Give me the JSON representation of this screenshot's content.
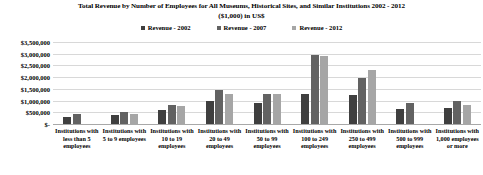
{
  "chart_data": {
    "type": "bar",
    "title": "Total Revenue by Number of Employees for All Museums, Historical Sites, and Similar Institutions 2002 - 2012",
    "subtitle": "($1,000) in US$",
    "xlabel": "",
    "ylabel": "",
    "ylim": [
      0,
      3500000
    ],
    "grid": true,
    "legend_position": "top-center",
    "categories": [
      "Institutions with less than 5 employees",
      "Institutions with 5 to 9 employees",
      "Institutions with 10 to 19 employees",
      "Institutions with 20 to 49 employees",
      "Institutions with 50 to 99 employees",
      "Institutions with 100 to 249 employees",
      "Institutions with 250 to 499 employees",
      "Institutions with 500 to 999 employees",
      "Institutions with 1,000 employees or more"
    ],
    "ytick_labels": [
      "$3,500,000",
      "$3,000,000",
      "$2,500,000",
      "$2,000,000",
      "$1,500,000",
      "$1,000,000",
      "$500,000",
      "$-"
    ],
    "ytick_values": [
      3500000,
      3000000,
      2500000,
      2000000,
      1500000,
      1000000,
      500000,
      0
    ],
    "series": [
      {
        "name": "Revenue - 2002",
        "color": "#3f3f3f",
        "values": [
          320000,
          370000,
          600000,
          1000000,
          900000,
          1300000,
          1250000,
          650000,
          700000
        ]
      },
      {
        "name": "Revenue - 2007",
        "color": "#626262",
        "values": [
          430000,
          500000,
          800000,
          1450000,
          1300000,
          2950000,
          1950000,
          900000,
          1000000
        ]
      },
      {
        "name": "Revenue - 2012",
        "color": "#a6a6a6",
        "values": [
          0,
          420000,
          750000,
          1300000,
          1300000,
          2900000,
          2300000,
          0,
          820000
        ]
      }
    ]
  }
}
